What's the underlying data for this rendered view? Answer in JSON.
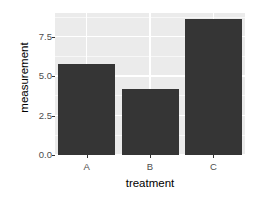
{
  "chart_data": {
    "type": "bar",
    "title": "",
    "subtitle": "",
    "categories": [
      "A",
      "B",
      "C"
    ],
    "values": [
      5.8,
      4.2,
      8.6
    ],
    "xlabel": "treatment",
    "ylabel": "measurement",
    "ylim": [
      0,
      9.0
    ],
    "yticks": [
      "0.0",
      "2.5",
      "5.0",
      "7.5"
    ],
    "ytick_values": [
      0.0,
      2.5,
      5.0,
      7.5
    ],
    "grid": "major and minor horizontal white gridlines, major vertical white gridlines at category centers",
    "legend": "none",
    "legend_position": "none",
    "bar_color": "#353535",
    "panel_background": "#ebebeb",
    "gridline_color": "#ffffff",
    "axis_text_color": "#4d4d4d",
    "axis_title_color": "#000000"
  },
  "axes": {
    "y": {
      "title": "measurement",
      "ticks": [
        {
          "label": "0.0",
          "value": 0.0
        },
        {
          "label": "2.5",
          "value": 2.5
        },
        {
          "label": "5.0",
          "value": 5.0
        },
        {
          "label": "7.5",
          "value": 7.5
        }
      ]
    },
    "x": {
      "title": "treatment",
      "ticks": [
        {
          "label": "A"
        },
        {
          "label": "B"
        },
        {
          "label": "C"
        }
      ]
    }
  }
}
